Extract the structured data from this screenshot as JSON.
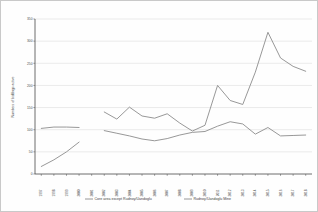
{
  "chart_data": {
    "type": "line",
    "title": "",
    "xlabel": "",
    "ylabel": "Numbers of biddings active",
    "ylim": [
      0,
      350
    ],
    "yticks": [
      0,
      50,
      100,
      150,
      200,
      250,
      300,
      350
    ],
    "ytick_labels": [
      "0",
      "50",
      "100",
      "150",
      "200",
      "250",
      "300",
      "350"
    ],
    "grid": true,
    "legend_position": "bottom",
    "categories": [
      "1997",
      "1998",
      "1999",
      "2000",
      "2001",
      "2002",
      "2003",
      "2004",
      "2005",
      "2006",
      "2007",
      "2008",
      "2009",
      "2010",
      "2011",
      "2012",
      "2013",
      "2014",
      "2015",
      "2016",
      "2017",
      "2018"
    ],
    "series": [
      {
        "name": "Core area except Rudnoy/Uandoglu",
        "color": "#8c8c8c",
        "values": [
          103,
          106,
          106,
          105,
          null,
          140,
          124,
          151,
          131,
          126,
          136,
          115,
          97,
          110,
          200,
          166,
          157,
          230,
          320,
          262,
          243,
          232
        ]
      },
      {
        "name": "Rudnoy/Uandoglu Mine",
        "color": "#8c8c8c",
        "values": [
          17,
          32,
          50,
          72,
          null,
          98,
          92,
          86,
          79,
          75,
          80,
          88,
          94,
          96,
          108,
          118,
          113,
          90,
          105,
          86,
          87,
          88
        ]
      }
    ]
  },
  "legend": {
    "entries": [
      {
        "label": "Core area except Rudnoy/Uandoglu"
      },
      {
        "label": "Rudnoy/Uandoglu Mine"
      }
    ]
  },
  "axes": {
    "y_title": "Numbers of biddings active"
  },
  "colors": {
    "series_1": "#8c8c8c",
    "series_2": "#8c8c8c",
    "grid": "#d6d6d6",
    "axis": "#4a4a4a",
    "frame": "#c9c9c9"
  }
}
